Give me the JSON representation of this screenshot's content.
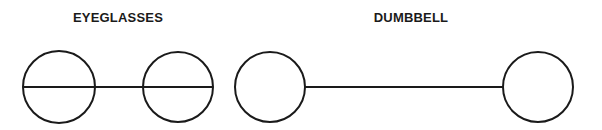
{
  "labels": {
    "eyeglasses": "EYEGLASSES",
    "dumbbell": "DUMBBELL"
  },
  "colors": {
    "stroke": "#1a1a1a",
    "background": "#ffffff"
  },
  "figures": [
    {
      "name": "eyeglasses",
      "label_center_x": 118,
      "circles": [
        {
          "cx": 59,
          "cy": 87,
          "r": 36,
          "diameter_line": true
        },
        {
          "cx": 178,
          "cy": 87,
          "r": 35,
          "diameter_line": true
        }
      ],
      "connector": {
        "x1": 95,
        "x2": 143,
        "y": 87
      }
    },
    {
      "name": "dumbbell",
      "label_center_x": 411,
      "circles": [
        {
          "cx": 270,
          "cy": 87,
          "r": 35,
          "diameter_line": false
        },
        {
          "cx": 538,
          "cy": 87,
          "r": 35,
          "diameter_line": false
        }
      ],
      "connector": {
        "x1": 305,
        "x2": 503,
        "y": 87
      }
    }
  ]
}
